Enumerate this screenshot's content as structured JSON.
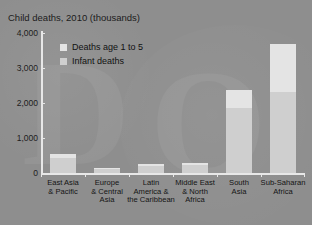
{
  "top_clipped_text": "·····",
  "chart_data": {
    "type": "bar",
    "subtype": "stacked-vertical",
    "title": "Child deaths, 2010 (thousands)",
    "xlabel": "",
    "ylabel": "",
    "ylim": [
      0,
      4000
    ],
    "ytick_labels": [
      "0",
      "1,000",
      "2,000",
      "3,000",
      "4,000"
    ],
    "ytick_values": [
      0,
      1000,
      2000,
      3000,
      4000
    ],
    "grid": false,
    "legend_position": "upper-left-inside",
    "categories": [
      "East Asia\n& Pacific",
      "Europe\n& Central\nAsia",
      "Latin\nAmerica &\nthe Caribbean",
      "Middle East\n& North\nAfrica",
      "South\nAsia",
      "Sub-Saharan\nAfrica"
    ],
    "series": [
      {
        "name": "Infant deaths",
        "color": "#cfcfcf",
        "values": [
          430,
          120,
          200,
          230,
          1860,
          2310
        ]
      },
      {
        "name": "Deaths age 1 to 5",
        "color": "#e4e4e4",
        "values": [
          110,
          30,
          60,
          60,
          510,
          1380
        ]
      }
    ],
    "totals": [
      540,
      150,
      260,
      290,
      2370,
      3690
    ]
  },
  "legend": {
    "items": [
      {
        "label": "Deaths age 1 to 5",
        "color": "#e4e4e4"
      },
      {
        "label": "Infant deaths",
        "color": "#cfcfcf"
      }
    ]
  },
  "colors": {
    "background": "#8e8e8e",
    "axis": "#e8e8e8",
    "text": "#141414",
    "infant": "#cfcfcf",
    "age1to5": "#e4e4e4"
  }
}
